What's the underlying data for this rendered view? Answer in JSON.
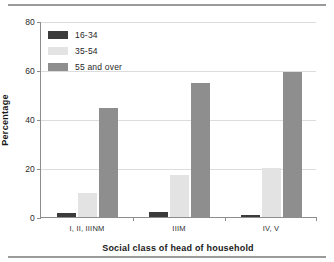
{
  "chart_data": {
    "type": "bar",
    "title": "",
    "xlabel": "Social class of head of household",
    "ylabel": "Percentage",
    "categories": [
      "I, II, IIINM",
      "IIIM",
      "IV, V"
    ],
    "series": [
      {
        "name": "16-34",
        "values": [
          1.5,
          2,
          1
        ],
        "color": "#3b3b3b"
      },
      {
        "name": "35-54",
        "values": [
          10,
          17,
          20
        ],
        "color": "#e3e3e3"
      },
      {
        "name": "55 and over",
        "values": [
          44.5,
          54.5,
          59
        ],
        "color": "#8e8e8e"
      }
    ],
    "ylim": [
      0,
      80
    ],
    "yticks": [
      0,
      20,
      40,
      60,
      80
    ],
    "ytick_labels": [
      "0",
      "20",
      "40",
      "60",
      "80"
    ],
    "grid": true,
    "legend_position": "top-left"
  },
  "colors": {
    "axis": "#8d8d8d",
    "grid": "#dcdcdc",
    "rule": "#9a9a9a",
    "text": "#1f1f1f"
  }
}
